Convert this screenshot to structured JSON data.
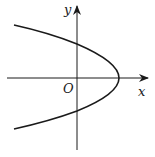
{
  "diagram": {
    "type": "parabola-graph",
    "labels": {
      "y_axis": "y",
      "x_axis": "x",
      "origin": "O"
    },
    "colors": {
      "stroke": "#1a1a1a",
      "background": "#ffffff"
    }
  }
}
